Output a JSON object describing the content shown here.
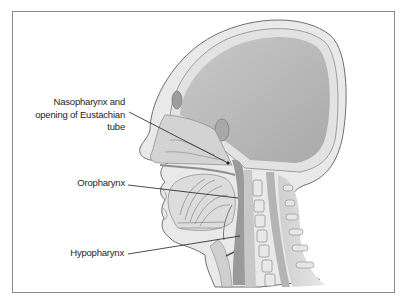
{
  "figure": {
    "labels": [
      {
        "id": "nasopharynx",
        "lines": [
          "Nasopharynx and",
          "opening of Eustachian",
          "tube"
        ]
      },
      {
        "id": "oropharynx",
        "lines": [
          "Oropharynx"
        ]
      },
      {
        "id": "hypopharynx",
        "lines": [
          "Hypopharynx"
        ]
      }
    ],
    "colors": {
      "frame": "#8a8a8a",
      "skin_outline": "#6f6f6f",
      "brain": "#b9b9b9",
      "bone": "#e4e4e4",
      "soft_tissue": "#d0d0d0",
      "airway": "#9a9a9a",
      "leader_line": "#1e1e1e"
    }
  }
}
